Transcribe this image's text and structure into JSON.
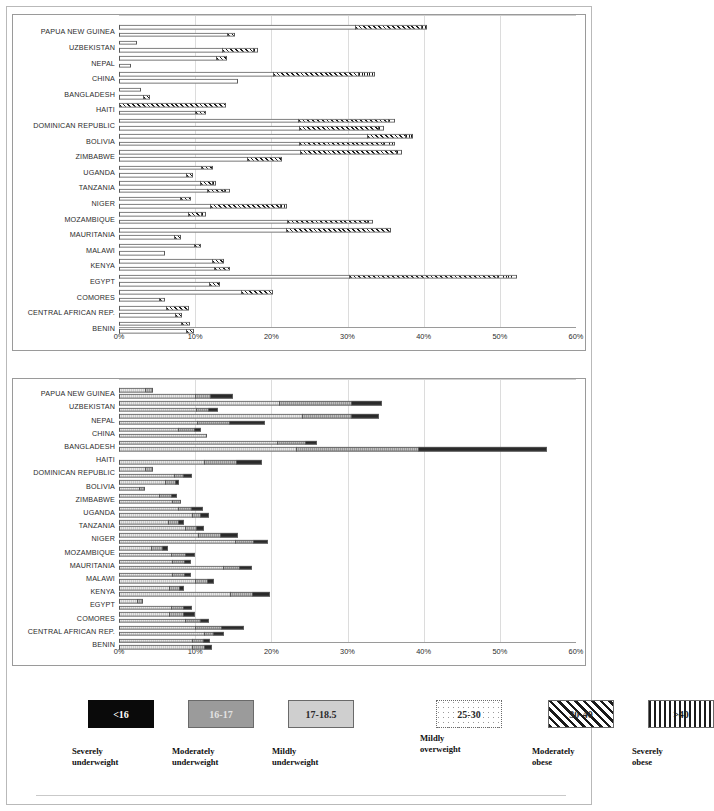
{
  "chart_data": [
    {
      "id": "top",
      "type": "bar",
      "orientation": "horizontal",
      "stacked": true,
      "title": "",
      "xlabel": "",
      "ylabel": "",
      "xlim": [
        0,
        60
      ],
      "xticks": [
        "0%",
        "10%",
        "20%",
        "30%",
        "40%",
        "50%",
        "60%"
      ],
      "grid": true,
      "legend_position": "bottom",
      "series": [
        {
          "name": "25-30",
          "key": "ow",
          "label": "Mildly overweight",
          "css": "s-ow"
        },
        {
          "name": "30-40",
          "key": "mo",
          "label": "Moderately obese",
          "css": "s-mo"
        },
        {
          "name": ">40",
          "key": "so",
          "label": "Severely obese",
          "css": "s-so"
        }
      ],
      "categories": [
        "PAPUA NEW GUINEA",
        "UZBEKISTAN",
        "NEPAL",
        "CHINA",
        "BANGLADESH",
        "HAITI",
        "DOMINICAN REPUBLIC",
        "BOLIVIA",
        "ZIMBABWE",
        "UGANDA",
        "TANZANIA",
        "NIGER",
        "MOZAMBIQUE",
        "MAURITANIA",
        "MALAWI",
        "KENYA",
        "EGYPT",
        "COMORES",
        "CENTRAL AFRICAN REP.",
        "BENIN"
      ],
      "groups": [
        {
          "category": "PAPUA NEW GUINEA",
          "bars": [
            {
              "ow": 31.0,
              "mo": 8.6,
              "so": 0.8
            },
            {
              "ow": 14.2,
              "mo": 1.0,
              "so": 0.0
            }
          ]
        },
        {
          "category": "UZBEKISTAN",
          "bars": [
            {
              "ow": 2.3,
              "mo": 0.0,
              "so": 0.0
            },
            {
              "ow": 13.5,
              "mo": 4.1,
              "so": 0.7
            }
          ]
        },
        {
          "category": "NEPAL",
          "bars": [
            {
              "ow": 12.8,
              "mo": 1.4,
              "so": 0.0
            },
            {
              "ow": 1.6,
              "mo": 0.0,
              "so": 0.0
            }
          ]
        },
        {
          "category": "CHINA",
          "bars": [
            {
              "ow": 20.2,
              "mo": 11.2,
              "so": 2.2
            },
            {
              "ow": 15.6,
              "mo": 0.0,
              "so": 0.0
            }
          ]
        },
        {
          "category": "BANGLADESH",
          "bars": [
            {
              "ow": 2.9,
              "mo": 0.0,
              "so": 0.0
            },
            {
              "ow": 3.2,
              "mo": 0.9,
              "so": 0.0
            }
          ]
        },
        {
          "category": "HAITI",
          "bars": [
            {
              "ow": 0.0,
              "mo": 14.0,
              "so": 0.0
            },
            {
              "ow": 10.0,
              "mo": 1.4,
              "so": 0.0
            }
          ]
        },
        {
          "category": "DOMINICAN REPUBLIC",
          "bars": [
            {
              "ow": 23.5,
              "mo": 11.8,
              "so": 1.0
            },
            {
              "ow": 23.6,
              "mo": 10.4,
              "so": 0.8
            }
          ]
        },
        {
          "category": "BOLIVIA",
          "bars": [
            {
              "ow": 32.5,
              "mo": 5.0,
              "so": 1.1
            },
            {
              "ow": 23.6,
              "mo": 11.0,
              "so": 1.6
            }
          ]
        },
        {
          "category": "ZIMBABWE",
          "bars": [
            {
              "ow": 23.8,
              "mo": 12.6,
              "so": 0.8
            },
            {
              "ow": 16.8,
              "mo": 4.6,
              "so": 0.0
            }
          ]
        },
        {
          "category": "UGANDA",
          "bars": [
            {
              "ow": 10.8,
              "mo": 1.5,
              "so": 0.0
            },
            {
              "ow": 8.8,
              "mo": 0.9,
              "so": 0.0
            }
          ]
        },
        {
          "category": "TANZANIA",
          "bars": [
            {
              "ow": 10.7,
              "mo": 1.5,
              "so": 0.6
            },
            {
              "ow": 11.6,
              "mo": 2.2,
              "so": 0.8
            }
          ]
        },
        {
          "category": "NIGER",
          "bars": [
            {
              "ow": 8.0,
              "mo": 1.5,
              "so": 0.0
            },
            {
              "ow": 12.0,
              "mo": 9.2,
              "so": 0.9
            }
          ]
        },
        {
          "category": "MOZAMBIQUE",
          "bars": [
            {
              "ow": 9.0,
              "mo": 1.8,
              "so": 0.6
            },
            {
              "ow": 22.0,
              "mo": 10.5,
              "so": 0.9
            }
          ]
        },
        {
          "category": "MAURITANIA",
          "bars": [
            {
              "ow": 21.9,
              "mo": 13.8,
              "so": 0.0
            },
            {
              "ow": 7.2,
              "mo": 0.9,
              "so": 0.0
            }
          ]
        },
        {
          "category": "MALAWI",
          "bars": [
            {
              "ow": 9.8,
              "mo": 1.0,
              "so": 0.0
            },
            {
              "ow": 6.0,
              "mo": 0.0,
              "so": 0.0
            }
          ]
        },
        {
          "category": "KENYA",
          "bars": [
            {
              "ow": 12.2,
              "mo": 1.6,
              "so": 0.0
            },
            {
              "ow": 12.5,
              "mo": 2.1,
              "so": 0.0
            }
          ]
        },
        {
          "category": "EGYPT",
          "bars": [
            {
              "ow": 30.2,
              "mo": 19.4,
              "so": 2.6
            },
            {
              "ow": 11.8,
              "mo": 1.5,
              "so": 0.0
            }
          ]
        },
        {
          "category": "COMORES",
          "bars": [
            {
              "ow": 16.0,
              "mo": 4.2,
              "so": 0.0
            },
            {
              "ow": 5.2,
              "mo": 0.9,
              "so": 0.0
            }
          ]
        },
        {
          "category": "CENTRAL AFRICAN REP.",
          "bars": [
            {
              "ow": 6.2,
              "mo": 3.0,
              "so": 0.0
            },
            {
              "ow": 7.4,
              "mo": 0.9,
              "so": 0.0
            }
          ]
        },
        {
          "category": "BENIN",
          "bars": [
            {
              "ow": 8.2,
              "mo": 1.1,
              "so": 0.0
            },
            {
              "ow": 8.8,
              "mo": 1.0,
              "so": 0.0
            }
          ]
        }
      ]
    },
    {
      "id": "bottom",
      "type": "bar",
      "orientation": "horizontal",
      "stacked": true,
      "title": "",
      "xlabel": "",
      "ylabel": "",
      "xlim": [
        0,
        60
      ],
      "xticks": [
        "0%",
        "10%",
        "20%",
        "30%",
        "40%",
        "50%",
        "60%"
      ],
      "grid": true,
      "legend_position": "bottom",
      "series": [
        {
          "name": "17-18.5",
          "key": "mu",
          "label": "Mildly underweight",
          "css": "s-mu"
        },
        {
          "name": "16-17",
          "key": "modu",
          "label": "Moderately underweight",
          "css": "s-modu"
        },
        {
          "name": "<16",
          "key": "su",
          "label": "Severely underweight",
          "css": "s-su"
        }
      ],
      "categories": [
        "PAPUA NEW GUINEA",
        "UZBEKISTAN",
        "NEPAL",
        "CHINA",
        "BANGLADESH",
        "HAITI",
        "DOMINICAN REPUBLIC",
        "BOLIVIA",
        "ZIMBABWE",
        "UGANDA",
        "TANZANIA",
        "NIGER",
        "MOZAMBIQUE",
        "MAURITANIA",
        "MALAWI",
        "KENYA",
        "EGYPT",
        "COMORES",
        "CENTRAL AFRICAN REP.",
        "BENIN"
      ],
      "groups": [
        {
          "category": "PAPUA NEW GUINEA",
          "bars": [
            {
              "mu": 3.4,
              "modu": 1.0,
              "su": 0.0
            },
            {
              "mu": 10.0,
              "modu": 2.0,
              "su": 3.0
            }
          ]
        },
        {
          "category": "UZBEKISTAN",
          "bars": [
            {
              "mu": 21.0,
              "modu": 9.5,
              "su": 4.0
            },
            {
              "mu": 10.1,
              "modu": 1.6,
              "su": 1.3
            }
          ]
        },
        {
          "category": "NEPAL",
          "bars": [
            {
              "mu": 24.0,
              "modu": 6.4,
              "su": 3.7
            },
            {
              "mu": 10.2,
              "modu": 4.2,
              "su": 4.8
            }
          ]
        },
        {
          "category": "CHINA",
          "bars": [
            {
              "mu": 7.8,
              "modu": 2.0,
              "su": 1.0
            },
            {
              "mu": 11.5,
              "modu": 0.0,
              "su": 0.0
            }
          ]
        },
        {
          "category": "BANGLADESH",
          "bars": [
            {
              "mu": 20.8,
              "modu": 3.6,
              "su": 1.6
            },
            {
              "mu": 23.2,
              "modu": 16.0,
              "su": 17.0
            }
          ]
        },
        {
          "category": "HAITI",
          "bars": [
            {
              "mu": 0.0,
              "modu": 0.0,
              "su": 0.0
            },
            {
              "mu": 11.2,
              "modu": 4.2,
              "su": 3.4
            }
          ]
        },
        {
          "category": "DOMINICAN REPUBLIC",
          "bars": [
            {
              "mu": 3.4,
              "modu": 1.1,
              "su": 0.0
            },
            {
              "mu": 7.2,
              "modu": 1.2,
              "su": 1.2
            }
          ]
        },
        {
          "category": "BOLIVIA",
          "bars": [
            {
              "mu": 6.0,
              "modu": 1.3,
              "su": 0.6
            },
            {
              "mu": 2.6,
              "modu": 0.8,
              "su": 0.0
            }
          ]
        },
        {
          "category": "ZIMBABWE",
          "bars": [
            {
              "mu": 5.2,
              "modu": 1.6,
              "su": 0.8
            },
            {
              "mu": 7.0,
              "modu": 1.2,
              "su": 0.0
            }
          ]
        },
        {
          "category": "UGANDA",
          "bars": [
            {
              "mu": 7.8,
              "modu": 1.6,
              "su": 1.6
            },
            {
              "mu": 9.6,
              "modu": 1.0,
              "su": 1.2
            }
          ]
        },
        {
          "category": "TANZANIA",
          "bars": [
            {
              "mu": 6.4,
              "modu": 1.4,
              "su": 0.8
            },
            {
              "mu": 8.6,
              "modu": 1.5,
              "su": 1.0
            }
          ]
        },
        {
          "category": "NIGER",
          "bars": [
            {
              "mu": 10.4,
              "modu": 2.9,
              "su": 2.3
            },
            {
              "mu": 15.2,
              "modu": 2.4,
              "su": 2.0
            }
          ]
        },
        {
          "category": "MOZAMBIQUE",
          "bars": [
            {
              "mu": 4.2,
              "modu": 1.4,
              "su": 0.9
            },
            {
              "mu": 6.8,
              "modu": 1.9,
              "su": 1.3
            }
          ]
        },
        {
          "category": "MAURITANIA",
          "bars": [
            {
              "mu": 7.0,
              "modu": 1.6,
              "su": 0.9
            },
            {
              "mu": 13.6,
              "modu": 2.2,
              "su": 1.6
            }
          ]
        },
        {
          "category": "MALAWI",
          "bars": [
            {
              "mu": 7.0,
              "modu": 1.6,
              "su": 0.8
            },
            {
              "mu": 10.0,
              "modu": 1.6,
              "su": 0.9
            }
          ]
        },
        {
          "category": "KENYA",
          "bars": [
            {
              "mu": 6.6,
              "modu": 1.3,
              "su": 0.7
            },
            {
              "mu": 14.6,
              "modu": 2.8,
              "su": 2.4
            }
          ]
        },
        {
          "category": "EGYPT",
          "bars": [
            {
              "mu": 2.4,
              "modu": 0.8,
              "su": 0.0
            },
            {
              "mu": 6.8,
              "modu": 1.6,
              "su": 1.2
            }
          ]
        },
        {
          "category": "COMORES",
          "bars": [
            {
              "mu": 6.6,
              "modu": 1.8,
              "su": 1.6
            },
            {
              "mu": 8.6,
              "modu": 2.0,
              "su": 1.2
            }
          ]
        },
        {
          "category": "CENTRAL AFRICAN REP.",
          "bars": [
            {
              "mu": 10.0,
              "modu": 3.4,
              "su": 3.0
            },
            {
              "mu": 11.2,
              "modu": 1.2,
              "su": 1.4
            }
          ]
        },
        {
          "category": "BENIN",
          "bars": [
            {
              "mu": 9.6,
              "modu": 1.4,
              "su": 1.0
            },
            {
              "mu": 9.6,
              "modu": 1.6,
              "su": 1.0
            }
          ]
        }
      ]
    }
  ],
  "legend": {
    "items": [
      {
        "code": "<16",
        "caption": "Severely\nunderweight",
        "swatch": "sw-su",
        "x": 52,
        "y": 10,
        "cx": 36,
        "cy": 56
      },
      {
        "code": "16-17",
        "caption": "Moderately\nunderweight",
        "swatch": "sw-modu",
        "x": 152,
        "y": 10,
        "cx": 136,
        "cy": 56
      },
      {
        "code": "17-18.5",
        "caption": "Mildly\nunderweight",
        "swatch": "sw-mu",
        "x": 252,
        "y": 10,
        "cx": 236,
        "cy": 56
      },
      {
        "code": "25-30",
        "caption": "Mildly\noverweight",
        "swatch": "sw-ow",
        "x": 400,
        "y": 10,
        "cx": 384,
        "cy": 43
      },
      {
        "code": "30-40",
        "caption": "Moderately\nobese",
        "swatch": "sw-mo",
        "x": 512,
        "y": 10,
        "cx": 496,
        "cy": 56
      },
      {
        "code": ">40",
        "caption": "Severely\nobese",
        "swatch": "sw-so",
        "x": 612,
        "y": 10,
        "cx": 596,
        "cy": 56
      }
    ]
  }
}
